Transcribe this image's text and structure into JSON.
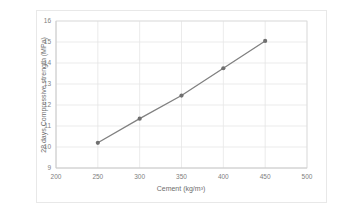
{
  "chart_data": {
    "type": "line",
    "title": "",
    "xlabel": "Cement  (kg/m³)",
    "ylabel": "28 days Compressive strength (MPa)",
    "x": [
      250,
      300,
      350,
      400,
      450
    ],
    "values": [
      10.2,
      11.35,
      12.45,
      13.75,
      15.05
    ],
    "series": [
      {
        "name": "28 days Compressive strength",
        "x": [
          250,
          300,
          350,
          400,
          450
        ],
        "values": [
          10.2,
          11.35,
          12.45,
          13.75,
          15.05
        ]
      }
    ],
    "xlim": [
      200,
      500
    ],
    "ylim": [
      9,
      16
    ],
    "xticks": [
      200,
      250,
      300,
      350,
      400,
      450,
      500
    ],
    "yticks": [
      9,
      10,
      11,
      12,
      13,
      14,
      15,
      16
    ],
    "xtick_labels": [
      "200",
      "250",
      "300",
      "350",
      "400",
      "450",
      "500"
    ],
    "ytick_labels": [
      "9",
      "10",
      "11",
      "12",
      "13",
      "14",
      "15",
      "16"
    ],
    "grid": true,
    "grid_axes": "both",
    "legend": false,
    "legend_position": "none",
    "marker": "circle",
    "line_color": "#808080",
    "marker_color": "#707070",
    "grid_color": "#e6e6e6",
    "axis_color": "#d0d0d0",
    "tick_label_color": "#808080",
    "axis_title_color": "#6e6e6e",
    "background_color": "#ffffff",
    "border_color": "#e8e8e8"
  }
}
